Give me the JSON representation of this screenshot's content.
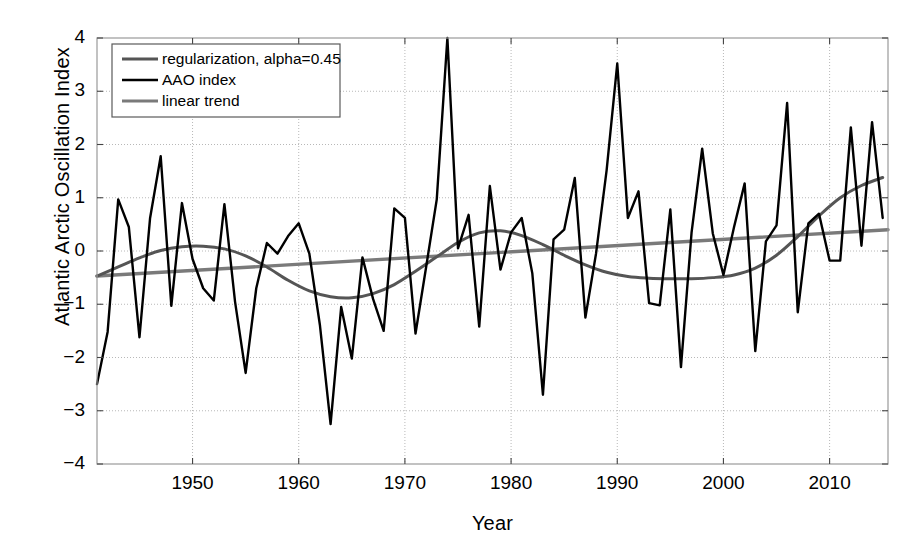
{
  "chart_data": {
    "type": "line",
    "title": "",
    "xlabel": "Year",
    "ylabel": "Atlantic Arctic Oscillation Index",
    "xlim": [
      1941,
      2015.5
    ],
    "ylim": [
      -4,
      4
    ],
    "grid": true,
    "grid_style": "dotted",
    "legend_position": "top-left",
    "xticks": [
      1950,
      1960,
      1970,
      1980,
      1990,
      2000,
      2010
    ],
    "xtick_labels": [
      "1950",
      "1960",
      "1970",
      "1980",
      "1990",
      "2000",
      "2010"
    ],
    "yticks": [
      -4,
      -3,
      -2,
      -1,
      0,
      1,
      2,
      3,
      4
    ],
    "ytick_labels": [
      "-4",
      "-3",
      "-2",
      "-1",
      "0",
      "1",
      "2",
      "3",
      "4"
    ],
    "series": [
      {
        "name": "regularization, alpha=0.45",
        "color": "#555555",
        "width": 3.0,
        "x": [
          1941,
          1943,
          1945,
          1947,
          1949,
          1951,
          1953,
          1955,
          1957,
          1959,
          1961,
          1963,
          1965,
          1967,
          1969,
          1971,
          1973,
          1975,
          1977,
          1979,
          1981,
          1983,
          1985,
          1987,
          1989,
          1991,
          1993,
          1995,
          1997,
          1999,
          2001,
          2003,
          2005,
          2007,
          2009,
          2011,
          2013,
          2015
        ],
        "values": [
          -0.47,
          -0.3,
          -0.13,
          0.01,
          0.08,
          0.09,
          0.04,
          -0.09,
          -0.3,
          -0.55,
          -0.75,
          -0.86,
          -0.88,
          -0.8,
          -0.63,
          -0.38,
          -0.11,
          0.16,
          0.34,
          0.38,
          0.29,
          0.12,
          -0.08,
          -0.26,
          -0.4,
          -0.48,
          -0.51,
          -0.52,
          -0.52,
          -0.5,
          -0.45,
          -0.32,
          -0.08,
          0.27,
          0.66,
          1.0,
          1.23,
          1.38
        ]
      },
      {
        "name": "AAO index",
        "color": "#000000",
        "width": 2.4,
        "x": [
          1941,
          1942,
          1943,
          1944,
          1945,
          1946,
          1947,
          1948,
          1949,
          1950,
          1951,
          1952,
          1953,
          1954,
          1955,
          1956,
          1957,
          1958,
          1959,
          1960,
          1961,
          1962,
          1963,
          1964,
          1965,
          1966,
          1967,
          1968,
          1969,
          1970,
          1971,
          1972,
          1973,
          1974,
          1975,
          1976,
          1977,
          1978,
          1979,
          1980,
          1981,
          1982,
          1983,
          1984,
          1985,
          1986,
          1987,
          1988,
          1989,
          1990,
          1991,
          1992,
          1993,
          1994,
          1995,
          1996,
          1997,
          1998,
          1999,
          2000,
          2001,
          2002,
          2003,
          2004,
          2005,
          2006,
          2007,
          2008,
          2009,
          2010,
          2011,
          2012,
          2013,
          2014,
          2015
        ],
        "values": [
          -2.5,
          -1.52,
          0.97,
          0.45,
          -1.62,
          0.62,
          1.78,
          -1.03,
          0.9,
          -0.15,
          -0.7,
          -0.93,
          0.88,
          -0.95,
          -2.29,
          -0.7,
          0.15,
          -0.05,
          0.28,
          0.52,
          -0.05,
          -1.4,
          -3.25,
          -1.05,
          -2.02,
          -0.12,
          -0.9,
          -1.5,
          0.8,
          0.62,
          -1.55,
          -0.3,
          0.97,
          4.0,
          0.05,
          0.68,
          -1.42,
          1.22,
          -0.35,
          0.35,
          0.62,
          -0.42,
          -2.7,
          0.22,
          0.4,
          1.37,
          -1.25,
          -0.05,
          1.52,
          3.52,
          0.62,
          1.12,
          -0.98,
          -1.02,
          0.78,
          -2.18,
          0.35,
          1.92,
          0.33,
          -0.45,
          0.45,
          1.27,
          -1.88,
          0.18,
          0.48,
          2.78,
          -1.15,
          0.52,
          0.7,
          -0.18,
          -0.18,
          2.32,
          0.1,
          2.42,
          0.62
        ]
      },
      {
        "name": "linear trend",
        "color": "#7a7a7a",
        "width": 3.4,
        "x": [
          1941,
          2015.5
        ],
        "values": [
          -0.47,
          0.4
        ]
      }
    ]
  },
  "legend": {
    "entries": [
      {
        "label": "regularization, alpha=0.45",
        "color": "#555555"
      },
      {
        "label": "AAO index",
        "color": "#000000"
      },
      {
        "label": "linear trend",
        "color": "#7a7a7a"
      }
    ]
  },
  "axes": {
    "x_title": "Year",
    "y_title": "Atlantic Arctic Oscillation Index"
  }
}
